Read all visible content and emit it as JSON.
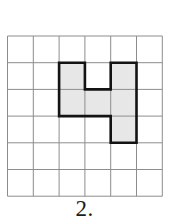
{
  "figure": {
    "label": "2."
  },
  "grid": {
    "cols": 6,
    "rows": 6,
    "line_color": "#8d8d8d",
    "background_color": "#ffffff"
  },
  "shape": {
    "fill_color": "#e7e7e7",
    "outline_color": "#131313",
    "shaded_cells": [
      [
        2,
        1
      ],
      [
        4,
        1
      ],
      [
        2,
        2
      ],
      [
        3,
        2
      ],
      [
        4,
        2
      ],
      [
        4,
        3
      ]
    ],
    "outline_vertices": [
      [
        2,
        1
      ],
      [
        3,
        1
      ],
      [
        3,
        2
      ],
      [
        4,
        2
      ],
      [
        4,
        1
      ],
      [
        5,
        1
      ],
      [
        5,
        4
      ],
      [
        4,
        4
      ],
      [
        4,
        3
      ],
      [
        2,
        3
      ]
    ]
  }
}
